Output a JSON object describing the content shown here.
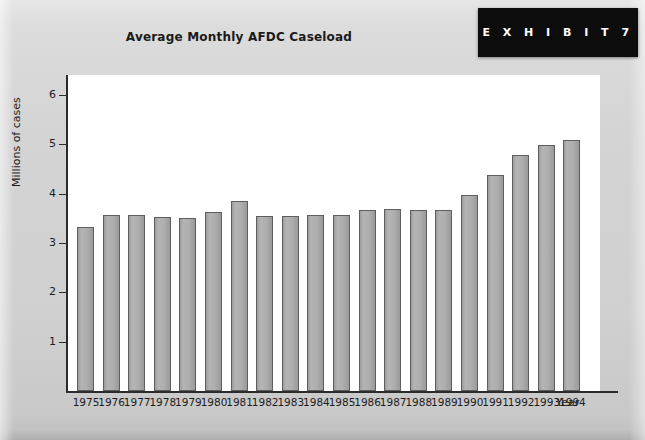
{
  "banner": {
    "label": "E X H I B I T   7"
  },
  "chart_data": {
    "type": "bar",
    "title": "Average Monthly AFDC Caseload",
    "xlabel": "Year",
    "ylabel": "Millions of cases",
    "ylim": [
      0,
      6.4
    ],
    "yticks": [
      1,
      2,
      3,
      4,
      5,
      6
    ],
    "ytick_labels": [
      "1",
      "2",
      "3",
      "4",
      "5",
      "6"
    ],
    "grid": false,
    "legend": null,
    "bar_color": "#ababab",
    "bar_edge_color": "#5e5e5e",
    "plot_background": "#ffffff",
    "page_background": "#d2d2d2",
    "categories": [
      "1975",
      "1976",
      "1977",
      "1978",
      "1979",
      "1980",
      "1981",
      "1982",
      "1983",
      "1984",
      "1985",
      "1986",
      "1987",
      "1988",
      "1989",
      "1990",
      "1991",
      "1992",
      "1993",
      "1994"
    ],
    "values": [
      3.33,
      3.56,
      3.56,
      3.52,
      3.5,
      3.63,
      3.84,
      3.55,
      3.55,
      3.57,
      3.56,
      3.66,
      3.68,
      3.67,
      3.67,
      3.97,
      4.37,
      4.77,
      4.98,
      5.08
    ]
  }
}
